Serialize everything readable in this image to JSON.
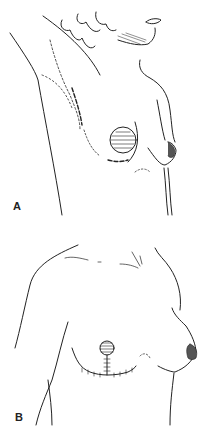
{
  "figure": {
    "panels": [
      {
        "id": "A",
        "label": "A",
        "description": "Preoperative view with dashed incision markings around breast and areola"
      },
      {
        "id": "B",
        "label": "B",
        "description": "Postoperative view with inverted-T sutured scar beneath areola"
      }
    ]
  },
  "colors": {
    "line": "#222222",
    "background": "#ffffff"
  }
}
